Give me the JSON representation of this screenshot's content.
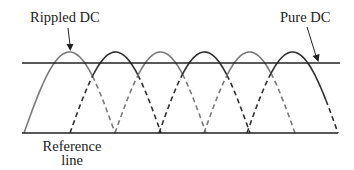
{
  "labels": {
    "rippled_dc": "Rippled DC",
    "pure_dc": "Pure DC",
    "reference_line_1": "Reference",
    "reference_line_2": "line"
  },
  "colors": {
    "background": "#ffffff",
    "line": "#222222",
    "arch_light": "#7a7a7a",
    "arch_dark": "#2f2f2f",
    "text": "#222222"
  },
  "geometry": {
    "pure_dc_y": 63,
    "reference_y": 133,
    "line_x_start": 22,
    "line_x_end": 340,
    "peak_y": 52,
    "arch_width": 91,
    "arch_starts": [
      24,
      70,
      115,
      159,
      204,
      247
    ],
    "arch_tones": [
      "light",
      "dark",
      "light",
      "dark",
      "light",
      "dark"
    ]
  }
}
